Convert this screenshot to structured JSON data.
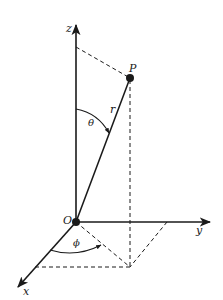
{
  "diagram": {
    "type": "spherical-coordinates",
    "colors": {
      "ink": "#1a1a1a",
      "background": "#ffffff"
    },
    "axes": {
      "z": {
        "label": "z"
      },
      "y": {
        "label": "y"
      },
      "x": {
        "label": "x"
      }
    },
    "points": {
      "origin": {
        "label": "O"
      },
      "p": {
        "label": "P"
      }
    },
    "quantities": {
      "radius": {
        "label": "r"
      },
      "polar_angle": {
        "label": "θ"
      },
      "azimuth_angle": {
        "label": "ϕ"
      }
    }
  }
}
